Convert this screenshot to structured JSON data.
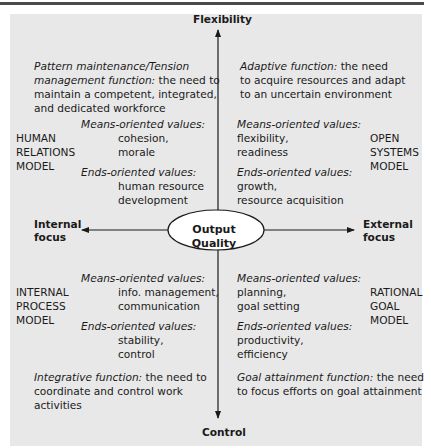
{
  "axes": {
    "top": "Flexibility",
    "bottom": "Control",
    "left": [
      "Internal",
      "focus"
    ],
    "right": [
      "External",
      "focus"
    ],
    "center": "Output Quality"
  },
  "quadrants": {
    "top_left": {
      "function_italic": "Pattern maintenance/Tension",
      "function_lines": [
        {
          "italic": "Pattern maintenance/Tension",
          "normal": ""
        },
        {
          "italic": "management function:",
          "normal": " the need to"
        },
        {
          "italic": "",
          "normal": "maintain a competent, integrated,"
        },
        {
          "italic": "",
          "normal": "and dedicated workforce"
        }
      ],
      "model": [
        "HUMAN",
        "RELATIONS",
        "MODEL"
      ],
      "means_label": "Means-oriented values:",
      "means": [
        "cohesion,",
        "morale"
      ],
      "ends_label": "Ends-oriented values:",
      "ends": [
        "human resource",
        "development"
      ]
    },
    "top_right": {
      "function_lines": [
        {
          "italic": "Adaptive function:",
          "normal": " the need"
        },
        {
          "italic": "",
          "normal": "to acquire resources and adapt"
        },
        {
          "italic": "",
          "normal": "to an uncertain environment"
        }
      ],
      "model": [
        "OPEN",
        "SYSTEMS",
        "MODEL"
      ],
      "means_label": "Means-oriented values:",
      "means": [
        "flexibility,",
        "readiness"
      ],
      "ends_label": "Ends-oriented values:",
      "ends": [
        "growth,",
        "resource acquisition"
      ]
    },
    "bottom_left": {
      "model": [
        "INTERNAL",
        "PROCESS",
        "MODEL"
      ],
      "means_label": "Means-oriented values:",
      "means": [
        "info. management,",
        "communication"
      ],
      "ends_label": "Ends-oriented values:",
      "ends": [
        "stability,",
        "control"
      ],
      "function_lines": [
        {
          "italic": "Integrative function:",
          "normal": " the need to"
        },
        {
          "italic": "",
          "normal": "coordinate and control work"
        },
        {
          "italic": "",
          "normal": "activities"
        }
      ]
    },
    "bottom_right": {
      "model": [
        "RATIONAL",
        "GOAL",
        "MODEL"
      ],
      "means_label": "Means-oriented values:",
      "means": [
        "planning,",
        "goal setting"
      ],
      "ends_label": "Ends-oriented values:",
      "ends": [
        "productivity,",
        "efficiency"
      ],
      "function_lines": [
        {
          "italic": "Goal attainment function:",
          "normal": " the need"
        },
        {
          "italic": "",
          "normal": "to focus efforts on goal attainment"
        }
      ]
    }
  }
}
